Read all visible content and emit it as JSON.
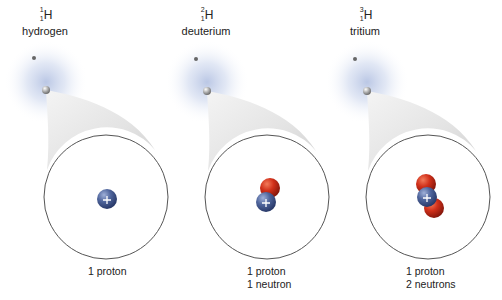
{
  "diagram": {
    "type": "isotope-comparison",
    "colors": {
      "proton": "#4a5f96",
      "neutron": "#c8281a",
      "electron_cloud": "#b8c6e2",
      "circle_stroke": "#555555",
      "callout_fill": "#e2e2e2"
    },
    "isotopes": [
      {
        "name": "hydrogen",
        "element": "H",
        "mass_number": "1",
        "atomic_number": "1",
        "caption_lines": [
          "1 proton"
        ],
        "protons": 1,
        "neutrons": 0
      },
      {
        "name": "deuterium",
        "element": "H",
        "mass_number": "2",
        "atomic_number": "1",
        "caption_lines": [
          "1 proton",
          "1 neutron"
        ],
        "protons": 1,
        "neutrons": 1
      },
      {
        "name": "tritium",
        "element": "H",
        "mass_number": "3",
        "atomic_number": "1",
        "caption_lines": [
          "1 proton",
          "2 neutrons"
        ],
        "protons": 1,
        "neutrons": 2
      }
    ],
    "proton_symbol": "+"
  }
}
